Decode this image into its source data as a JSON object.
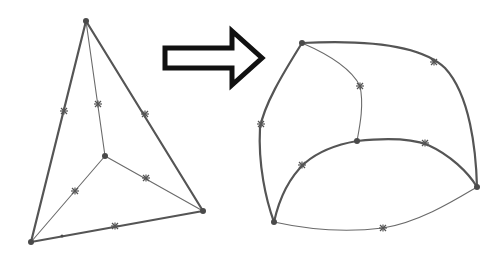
{
  "diagram": {
    "title": "",
    "colors": {
      "background": "#ffffff",
      "edge": "#555555",
      "node": "#4a4a4a",
      "arrow_outline": "#111111"
    },
    "arrow": {
      "direction": "right",
      "style": "hollow-outline",
      "from": [
        163,
        58
      ],
      "to": [
        265,
        58
      ]
    },
    "left_element": {
      "label": "straight-edged tetrahedron",
      "corner_nodes": [
        {
          "id": "A",
          "x": 86,
          "y": 21
        },
        {
          "id": "B",
          "x": 105,
          "y": 156
        },
        {
          "id": "C",
          "x": 31,
          "y": 242
        },
        {
          "id": "D",
          "x": 203,
          "y": 211
        }
      ],
      "mid_nodes": [
        {
          "edge": "A-C",
          "x": 64,
          "y": 111
        },
        {
          "edge": "A-B",
          "x": 98,
          "y": 104
        },
        {
          "edge": "A-D",
          "x": 145,
          "y": 114
        },
        {
          "edge": "B-C",
          "x": 75,
          "y": 191
        },
        {
          "edge": "B-D",
          "x": 146,
          "y": 178
        },
        {
          "edge": "C-D",
          "x": 115,
          "y": 226
        }
      ],
      "edges": [
        {
          "from": "A",
          "to": "C",
          "weight": "thick"
        },
        {
          "from": "A",
          "to": "D",
          "weight": "thick"
        },
        {
          "from": "C",
          "to": "D",
          "weight": "thick"
        },
        {
          "from": "A",
          "to": "B",
          "weight": "thin"
        },
        {
          "from": "B",
          "to": "C",
          "weight": "thin"
        },
        {
          "from": "B",
          "to": "D",
          "weight": "thin"
        }
      ]
    },
    "right_element": {
      "label": "curved-edge element",
      "corner_nodes": [
        {
          "id": "A",
          "x": 302,
          "y": 43
        },
        {
          "id": "B",
          "x": 357,
          "y": 141
        },
        {
          "id": "C",
          "x": 274,
          "y": 222
        },
        {
          "id": "D",
          "x": 477,
          "y": 187
        }
      ],
      "mid_nodes": [
        {
          "edge": "A-C",
          "x": 261,
          "y": 124
        },
        {
          "edge": "A-B",
          "x": 360,
          "y": 86
        },
        {
          "edge": "A-D",
          "x": 434,
          "y": 62
        },
        {
          "edge": "B-C",
          "x": 302,
          "y": 165
        },
        {
          "edge": "B-D",
          "x": 425,
          "y": 143
        },
        {
          "edge": "C-D",
          "x": 383,
          "y": 228
        }
      ]
    }
  }
}
